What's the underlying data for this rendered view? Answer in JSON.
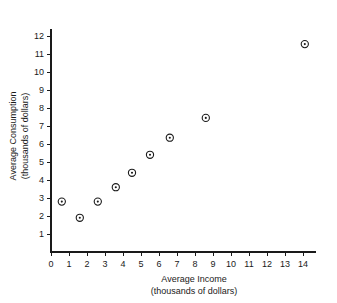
{
  "chart_data": {
    "type": "scatter",
    "title": "",
    "xlabel": "Average Income",
    "xlabel_sub": "(thousands of dollars)",
    "ylabel": "Average Consumption",
    "ylabel_sub": "(thousands of dollars)",
    "xlim": [
      0,
      14.7
    ],
    "ylim": [
      0,
      12.4
    ],
    "grid": false,
    "legend": "none",
    "marker": "circle-with-center-dot",
    "xticks": [
      0,
      1,
      2,
      3,
      4,
      5,
      6,
      7,
      8,
      9,
      10,
      11,
      12,
      13,
      14
    ],
    "xtick_labels": [
      "0",
      "1",
      "2",
      "3",
      "4",
      "5",
      "6",
      "7",
      "8",
      "9",
      "10",
      "11",
      "12",
      "13",
      "14"
    ],
    "yticks": [
      1,
      2,
      3,
      4,
      5,
      6,
      7,
      8,
      9,
      10,
      11,
      12
    ],
    "ytick_labels": [
      "1",
      "2",
      "3",
      "4",
      "5",
      "6",
      "7",
      "8",
      "9",
      "10",
      "11",
      "12"
    ],
    "points": [
      {
        "x": 0.6,
        "y": 2.8
      },
      {
        "x": 1.6,
        "y": 1.9
      },
      {
        "x": 2.6,
        "y": 2.8
      },
      {
        "x": 3.6,
        "y": 3.6
      },
      {
        "x": 4.5,
        "y": 4.4
      },
      {
        "x": 5.5,
        "y": 5.4
      },
      {
        "x": 6.6,
        "y": 6.35
      },
      {
        "x": 8.6,
        "y": 7.45
      },
      {
        "x": 14.1,
        "y": 11.55
      }
    ],
    "series": [
      {
        "name": "income-consumption",
        "x": [
          0.6,
          1.6,
          2.6,
          3.6,
          4.5,
          5.5,
          6.6,
          8.6,
          14.1
        ],
        "values": [
          2.8,
          1.9,
          2.8,
          3.6,
          4.4,
          5.4,
          6.35,
          7.45,
          11.55
        ]
      }
    ],
    "colors": {
      "marker": "#1a1a1a",
      "axis": "#1a1a1a",
      "background": "#ffffff"
    }
  }
}
